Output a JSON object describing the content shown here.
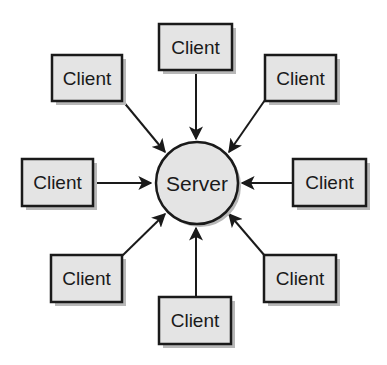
{
  "diagram": {
    "type": "client-server star topology",
    "server": {
      "label": "Server",
      "cx": 197,
      "cy": 183,
      "r": 41
    },
    "clients": [
      {
        "id": "top",
        "label": "Client",
        "x": 159,
        "y": 24,
        "w": 73,
        "h": 46
      },
      {
        "id": "top-left",
        "label": "Client",
        "x": 52,
        "y": 55,
        "w": 70,
        "h": 46
      },
      {
        "id": "top-right",
        "label": "Client",
        "x": 265,
        "y": 55,
        "w": 71,
        "h": 46
      },
      {
        "id": "left",
        "label": "Client",
        "x": 22,
        "y": 159,
        "w": 71,
        "h": 47
      },
      {
        "id": "right",
        "label": "Client",
        "x": 293,
        "y": 159,
        "w": 73,
        "h": 47
      },
      {
        "id": "bottom-left",
        "label": "Client",
        "x": 51,
        "y": 255,
        "w": 71,
        "h": 47
      },
      {
        "id": "bottom",
        "label": "Client",
        "x": 159,
        "y": 297,
        "w": 72,
        "h": 47
      },
      {
        "id": "bottom-right",
        "label": "Client",
        "x": 264,
        "y": 255,
        "w": 72,
        "h": 47
      }
    ],
    "edges": [
      {
        "from": "top",
        "to": "server"
      },
      {
        "from": "top-left",
        "to": "server"
      },
      {
        "from": "top-right",
        "to": "server"
      },
      {
        "from": "left",
        "to": "server"
      },
      {
        "from": "right",
        "to": "server"
      },
      {
        "from": "bottom-left",
        "to": "server"
      },
      {
        "from": "bottom",
        "to": "server"
      },
      {
        "from": "bottom-right",
        "to": "server"
      }
    ],
    "colors": {
      "node_fill": "#e4e4e4",
      "stroke": "#1a1a1a",
      "shadow": "#b8b8b8",
      "background": "#ffffff"
    }
  }
}
